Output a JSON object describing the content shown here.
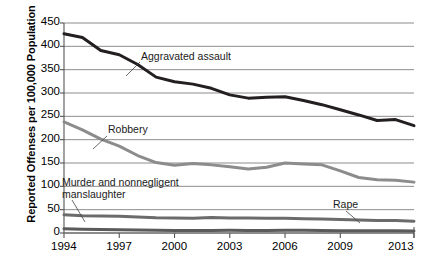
{
  "chart_data": {
    "type": "line",
    "title": "",
    "xlabel": "",
    "ylabel": "Reported Offenses per 100,000 Population",
    "xlim": [
      1994,
      2013
    ],
    "ylim": [
      0,
      450
    ],
    "grid": true,
    "legend_position": "inline-annotations",
    "x": [
      1994,
      1995,
      1996,
      1997,
      1998,
      1999,
      2000,
      2001,
      2002,
      2003,
      2004,
      2005,
      2006,
      2007,
      2008,
      2009,
      2010,
      2011,
      2012,
      2013
    ],
    "xtick_labels": [
      "1994",
      "1997",
      "2000",
      "2003",
      "2006",
      "2009",
      "2013"
    ],
    "xtick_values": [
      1994,
      1997,
      2000,
      2003,
      2006,
      2009,
      2013
    ],
    "ytick_labels": [
      "0",
      "50",
      "100",
      "150",
      "200",
      "250",
      "300",
      "350",
      "400",
      "450"
    ],
    "ytick_values": [
      0,
      50,
      100,
      150,
      200,
      250,
      300,
      350,
      400,
      450
    ],
    "series": [
      {
        "name": "Aggravated assault",
        "color": "#231f20",
        "width": 3.0,
        "label_x": 141,
        "label_y": 50,
        "leader": [
          [
            140,
            62
          ],
          [
            126,
            76
          ]
        ],
        "values": [
          427,
          419,
          391,
          382,
          361,
          334,
          324,
          319,
          310,
          296,
          289,
          291,
          292,
          284,
          275,
          264,
          253,
          241,
          243,
          230
        ]
      },
      {
        "name": "Robbery",
        "color": "#8c8c8c",
        "width": 3.0,
        "label_x": 108,
        "label_y": 123,
        "leader": [
          [
            107,
            136
          ],
          [
            93,
            149
          ]
        ],
        "values": [
          238,
          221,
          201,
          186,
          166,
          151,
          145,
          149,
          146,
          142,
          137,
          141,
          150,
          148,
          146,
          133,
          119,
          114,
          113,
          109
        ]
      },
      {
        "name": "Murder and nonnegligent manslaughter",
        "color": "#5a5a5a",
        "width": 3.0,
        "label_x": 62,
        "label_y": 176,
        "label_line2": "manslaughter",
        "leader": [
          [
            72,
            200
          ],
          [
            85,
            222
          ]
        ],
        "values": [
          9,
          8.2,
          7.4,
          6.8,
          6.3,
          5.7,
          5.5,
          5.6,
          5.6,
          5.7,
          5.5,
          5.6,
          5.8,
          5.7,
          5.4,
          5.0,
          4.8,
          4.7,
          4.7,
          4.5
        ]
      },
      {
        "name": "Rape",
        "color": "#6b6b6b",
        "width": 3.0,
        "label_x": 333,
        "label_y": 198,
        "leader": [
          [
            346,
            211
          ],
          [
            360,
            223
          ]
        ],
        "values": [
          39,
          37.1,
          36.3,
          35.9,
          34.5,
          32.8,
          32,
          31.8,
          33.1,
          32.3,
          32.4,
          31.8,
          31.6,
          30.6,
          29.8,
          29.1,
          27.7,
          27,
          26.9,
          25.2
        ]
      }
    ]
  },
  "axis": {
    "ylabel_text": "Reported Offenses per 100,000 Population"
  }
}
